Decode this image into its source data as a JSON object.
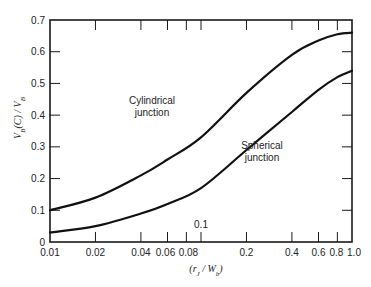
{
  "chart_data": {
    "type": "line",
    "title": "",
    "xlabel": "(r_J / W_b)",
    "ylabel": "V_B(C) / V_B",
    "xscale": "log",
    "xlim": [
      0.01,
      1.0
    ],
    "ylim": [
      0,
      0.7
    ],
    "grid": false,
    "legend": "inline curve labels",
    "x_ticks": [
      0.01,
      0.02,
      0.04,
      0.06,
      0.08,
      0.1,
      0.2,
      0.4,
      0.6,
      0.8,
      1.0
    ],
    "x_tick_labels": [
      "0.01",
      "0.02",
      "0.04",
      "0.06",
      "0.08",
      "0.1",
      "0.2",
      "0.4",
      "0.6",
      "0.8",
      "1.0"
    ],
    "y_ticks": [
      0,
      0.1,
      0.2,
      0.3,
      0.4,
      0.5,
      0.6,
      0.7
    ],
    "y_tick_labels": [
      "0",
      "0.1",
      "0.2",
      "0.3",
      "0.4",
      "0.5",
      "0.6",
      "0.7"
    ],
    "x": [
      0.01,
      0.02,
      0.04,
      0.06,
      0.1,
      0.2,
      0.4,
      0.6,
      0.8,
      1.0
    ],
    "series": [
      {
        "name": "Cylindrical junction",
        "label_lines": [
          "Cylindrical",
          "junction"
        ],
        "values": [
          0.1,
          0.14,
          0.21,
          0.26,
          0.33,
          0.47,
          0.59,
          0.635,
          0.655,
          0.66
        ]
      },
      {
        "name": "Spherical junction",
        "label_lines": [
          "Spherical",
          "junction"
        ],
        "values": [
          0.03,
          0.05,
          0.09,
          0.12,
          0.17,
          0.29,
          0.41,
          0.48,
          0.52,
          0.54
        ]
      }
    ],
    "annotations": [
      {
        "text": "0.1",
        "x": 0.1,
        "y": 0.02,
        "note": "label for 0.1 tick placed above axis"
      }
    ]
  }
}
